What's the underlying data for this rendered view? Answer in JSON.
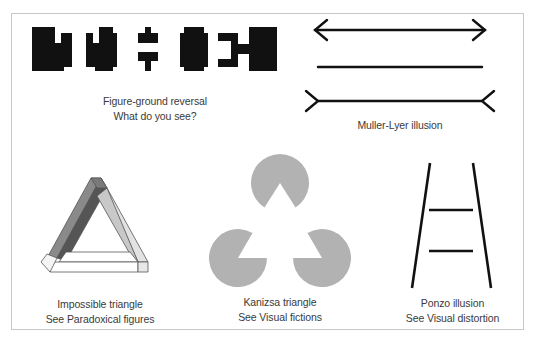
{
  "panels": {
    "figure_ground": {
      "title": "Figure-ground reversal",
      "subtitle": "What do you see?"
    },
    "muller_lyer": {
      "title": "Muller-Lyer illusion"
    },
    "impossible_triangle": {
      "title": "Impossible triangle",
      "subtitle": "See Paradoxical figures"
    },
    "kanizsa": {
      "title": "Kanizsa triangle",
      "subtitle": "See Visual fictions"
    },
    "ponzo": {
      "title": "Ponzo illusion",
      "subtitle": "See Visual distortion"
    }
  },
  "colors": {
    "ink": "#111111",
    "pacman_gray": "#b2b2b2",
    "frame_border": "#c8c8c8",
    "caption_text": "#3a3a3a"
  }
}
